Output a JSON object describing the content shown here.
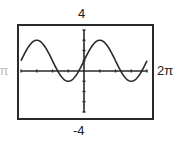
{
  "chart_data": {
    "type": "line",
    "title": "",
    "function": "2*sin(x) + 1",
    "xlim": [
      -6.2832,
      6.2832
    ],
    "ylim": [
      -4,
      4
    ],
    "xlabel": "",
    "ylabel": "",
    "x_tick_step": 1.5708,
    "y_tick_step": 1,
    "grid": false,
    "legend": "none",
    "window_labels": {
      "ymax": "4",
      "ymin": "-4",
      "xmax": "2π",
      "xmin": "-2π"
    },
    "series": [
      {
        "name": "y = 2 sin x + 1",
        "color": "#2a2a2a",
        "x": [
          -6.2832,
          -5.4978,
          -4.7124,
          -3.927,
          -3.1416,
          -2.3562,
          -1.5708,
          -0.7854,
          0,
          0.7854,
          1.5708,
          2.3562,
          3.1416,
          3.927,
          4.7124,
          5.4978,
          6.2832
        ],
        "y": [
          1,
          2.414,
          3,
          2.414,
          1,
          -0.414,
          -1,
          -0.414,
          1,
          2.414,
          3,
          2.414,
          1,
          -0.414,
          -1,
          -0.414,
          1
        ]
      }
    ]
  }
}
